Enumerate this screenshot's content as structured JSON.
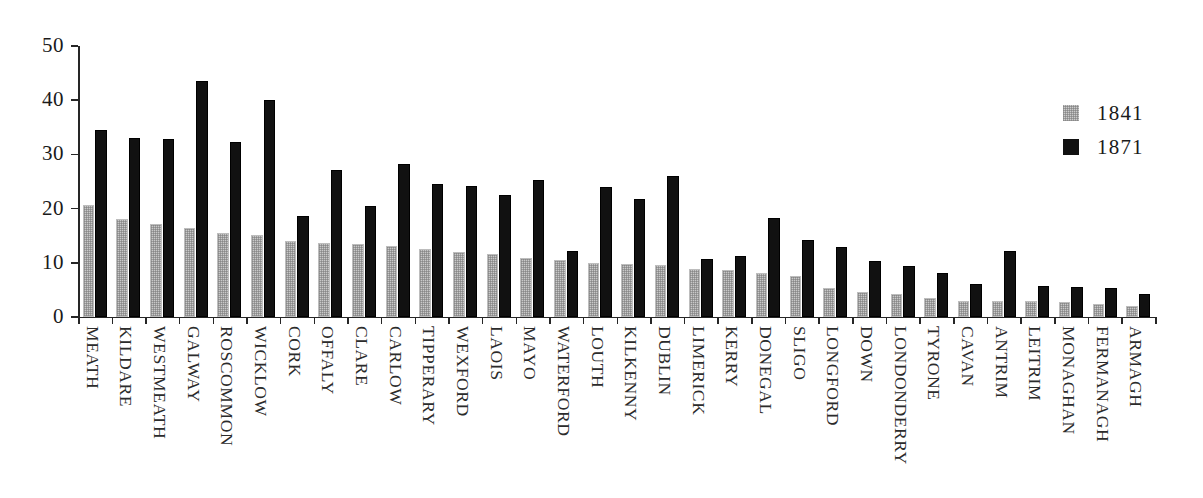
{
  "chart_data": {
    "type": "bar",
    "title": "",
    "subtitle": "",
    "xlabel": "",
    "ylabel": "",
    "ylim": [
      0,
      50
    ],
    "yticks": [
      0,
      10,
      20,
      30,
      40,
      50
    ],
    "ytick_labels": [
      "0",
      "10",
      "20",
      "30",
      "40",
      "50"
    ],
    "grid": false,
    "legend_position": "right",
    "categories": [
      "MEATH",
      "KILDARE",
      "WESTMEATH",
      "GALWAY",
      "ROSCOMMON",
      "WICKLOW",
      "CORK",
      "OFFALY",
      "CLARE",
      "CARLOW",
      "TIPPERARY",
      "WEXFORD",
      "LAOIS",
      "MAYO",
      "WATERFORD",
      "LOUTH",
      "KILKENNY",
      "DUBLIN",
      "LIMERICK",
      "KERRY",
      "DONEGAL",
      "SLIGO",
      "LONGFORD",
      "DOWN",
      "LONDONDERRY",
      "TYRONE",
      "CAVAN",
      "ANTRIM",
      "LEITRIM",
      "MONAGHAN",
      "FERMANAGH",
      "ARMAGH"
    ],
    "series": [
      {
        "name": "1841",
        "color": "#cccccc",
        "values": [
          20.6,
          18.0,
          17.2,
          16.4,
          15.5,
          15.2,
          14.0,
          13.7,
          13.4,
          13.1,
          12.5,
          12.0,
          11.6,
          10.8,
          10.5,
          10.0,
          9.8,
          9.6,
          8.9,
          8.7,
          8.1,
          7.5,
          5.4,
          4.6,
          4.2,
          3.5,
          3.0,
          2.9,
          2.9,
          2.8,
          2.4,
          2.0
        ]
      },
      {
        "name": "1871",
        "color": "#111111",
        "values": [
          34.5,
          33.1,
          32.8,
          43.5,
          32.2,
          40.0,
          18.6,
          27.1,
          20.4,
          28.2,
          24.5,
          24.2,
          22.6,
          25.2,
          12.2,
          23.9,
          21.8,
          26.1,
          10.7,
          11.3,
          18.3,
          14.3,
          13.0,
          10.4,
          9.4,
          8.1,
          6.0,
          12.1,
          5.8,
          5.5,
          5.4,
          4.3
        ]
      }
    ]
  },
  "legend": {
    "entries": [
      {
        "label": "1841",
        "swatch": "legend-swatch-1841"
      },
      {
        "label": "1871",
        "swatch": "legend-swatch-1871"
      }
    ]
  }
}
